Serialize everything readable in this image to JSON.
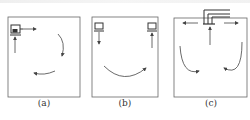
{
  "figure": {
    "panels": [
      {
        "id": "a",
        "label": "(a)",
        "description": "Single unit at top-left corner with inlet from below and outlet to the right; circular clockwise airflow"
      },
      {
        "id": "b",
        "label": "(b)",
        "description": "Two units at top corners, left supplies downward, right returns upward; U-shaped airflow left to right"
      },
      {
        "id": "c",
        "label": "(c)",
        "description": "Ceiling duct at top center with outlets left and right and central return; two downward vortices"
      }
    ],
    "colors": {
      "line": "#555555",
      "background": "#ffffff"
    }
  }
}
